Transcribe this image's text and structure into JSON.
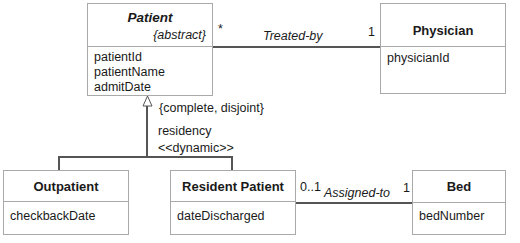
{
  "classes": {
    "patient": {
      "name": "Patient",
      "stereotype": "{abstract}",
      "attributes": [
        "patientId",
        "patientName",
        "admitDate"
      ]
    },
    "physician": {
      "name": "Physician",
      "attributes": [
        "physicianId"
      ]
    },
    "outpatient": {
      "name": "Outpatient",
      "attributes": [
        "checkbackDate"
      ]
    },
    "resident": {
      "name": "Resident Patient",
      "attributes": [
        "dateDischarged"
      ]
    },
    "bed": {
      "name": "Bed",
      "attributes": [
        "bedNumber"
      ]
    }
  },
  "associations": {
    "treated_by": {
      "name": "Treated-by",
      "mult_patient": "*",
      "mult_physician": "1"
    },
    "assigned_to": {
      "name": "Assigned-to",
      "mult_resident": "0..1",
      "mult_bed": "1"
    }
  },
  "generalization": {
    "constraint": "{complete, disjoint}",
    "discriminator": "residency",
    "stereotype": "<<dynamic>>"
  }
}
